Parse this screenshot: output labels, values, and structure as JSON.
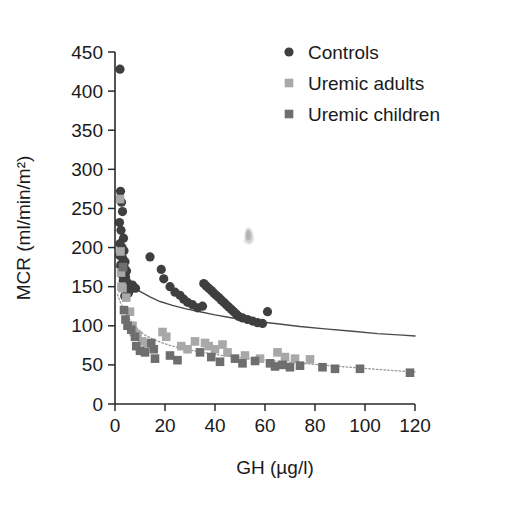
{
  "chart_data": {
    "type": "scatter",
    "title": "",
    "xlabel": "GH (µg/l)",
    "ylabel": "MCR (ml/min/m²)",
    "xlim": [
      0,
      120
    ],
    "ylim": [
      0,
      450
    ],
    "xticks": [
      0,
      20,
      40,
      60,
      80,
      100,
      120
    ],
    "yticks": [
      0,
      50,
      100,
      150,
      200,
      250,
      300,
      350,
      400,
      450
    ],
    "xtick_labels": [
      "0",
      "20",
      "40",
      "60",
      "80",
      "100",
      "120"
    ],
    "ytick_labels": [
      "0",
      "50",
      "100",
      "150",
      "200",
      "250",
      "300",
      "350",
      "400",
      "450"
    ],
    "grid": false,
    "legend_position": "top-right",
    "colors": {
      "controls": "#3f3f3f",
      "uremic_adults": "#a8a8a8",
      "uremic_children": "#6e6e6e",
      "controls_curve": "#4a4a4a",
      "uremic_curve": "#9a9a9a",
      "axis": "#2b2b2b",
      "text": "#1a1a1a",
      "background": "#ffffff"
    },
    "series": [
      {
        "name": "Controls",
        "marker": "circle",
        "color": "#3f3f3f",
        "points": [
          [
            2.0,
            428
          ],
          [
            2.2,
            272
          ],
          [
            2.6,
            258
          ],
          [
            3.0,
            246
          ],
          [
            1.8,
            232
          ],
          [
            2.4,
            222
          ],
          [
            3.4,
            212
          ],
          [
            2.0,
            205
          ],
          [
            2.8,
            200
          ],
          [
            3.6,
            196
          ],
          [
            1.9,
            190
          ],
          [
            3.1,
            186
          ],
          [
            4.0,
            182
          ],
          [
            2.3,
            178
          ],
          [
            3.8,
            174
          ],
          [
            4.6,
            170
          ],
          [
            2.7,
            166
          ],
          [
            4.2,
            162
          ],
          [
            3.3,
            158
          ],
          [
            5.0,
            155
          ],
          [
            4.8,
            150
          ],
          [
            6.0,
            146
          ],
          [
            5.4,
            142
          ],
          [
            3.9,
            138
          ],
          [
            7.0,
            152
          ],
          [
            8.2,
            148
          ],
          [
            18.5,
            172
          ],
          [
            19.5,
            160
          ],
          [
            22.0,
            150
          ],
          [
            24.0,
            143
          ],
          [
            26.0,
            139
          ],
          [
            27.5,
            134
          ],
          [
            29.0,
            130
          ],
          [
            31.0,
            127
          ],
          [
            33.0,
            123
          ],
          [
            35.5,
            154
          ],
          [
            36.5,
            151
          ],
          [
            37.5,
            148
          ],
          [
            38.5,
            145
          ],
          [
            39.5,
            142
          ],
          [
            40.5,
            139
          ],
          [
            41.5,
            136
          ],
          [
            42.5,
            133
          ],
          [
            43.5,
            130
          ],
          [
            44.5,
            127
          ],
          [
            45.5,
            124
          ],
          [
            46.5,
            121
          ],
          [
            47.5,
            118
          ],
          [
            48.5,
            115
          ],
          [
            49.5,
            112
          ],
          [
            51.0,
            110
          ],
          [
            53.0,
            108
          ],
          [
            55.0,
            106
          ],
          [
            57.0,
            104
          ],
          [
            59.0,
            103
          ],
          [
            61.0,
            118
          ],
          [
            35.0,
            125
          ],
          [
            14.0,
            188
          ]
        ]
      },
      {
        "name": "Uremic adults",
        "marker": "square",
        "color": "#a8a8a8",
        "points": [
          [
            2.0,
            262
          ],
          [
            2.2,
            195
          ],
          [
            2.4,
            168
          ],
          [
            2.6,
            150
          ],
          [
            3.0,
            148
          ],
          [
            4.5,
            136
          ],
          [
            6.0,
            118
          ],
          [
            7.0,
            100
          ],
          [
            7.5,
            92
          ],
          [
            9.0,
            88
          ],
          [
            11.0,
            80
          ],
          [
            13.0,
            76
          ],
          [
            19.0,
            92
          ],
          [
            20.5,
            86
          ],
          [
            26.5,
            74
          ],
          [
            29.0,
            70
          ],
          [
            32.0,
            80
          ],
          [
            36.0,
            78
          ],
          [
            37.5,
            74
          ],
          [
            40.0,
            70
          ],
          [
            43.0,
            76
          ],
          [
            45.0,
            66
          ],
          [
            52.0,
            62
          ],
          [
            58.0,
            58
          ],
          [
            65.0,
            66
          ],
          [
            68.0,
            60
          ],
          [
            72.0,
            58
          ],
          [
            78.0,
            57
          ]
        ]
      },
      {
        "name": "Uremic children",
        "marker": "square",
        "color": "#6e6e6e",
        "points": [
          [
            3.2,
            175
          ],
          [
            3.6,
            120
          ],
          [
            4.2,
            108
          ],
          [
            5.0,
            100
          ],
          [
            6.5,
            95
          ],
          [
            8.0,
            86
          ],
          [
            8.5,
            74
          ],
          [
            10.0,
            68
          ],
          [
            12.0,
            66
          ],
          [
            14.5,
            78
          ],
          [
            15.5,
            70
          ],
          [
            16.0,
            58
          ],
          [
            22.0,
            62
          ],
          [
            25.0,
            56
          ],
          [
            34.0,
            66
          ],
          [
            38.5,
            60
          ],
          [
            42.0,
            54
          ],
          [
            48.0,
            58
          ],
          [
            51.0,
            52
          ],
          [
            56.0,
            55
          ],
          [
            62.0,
            52
          ],
          [
            64.0,
            48
          ],
          [
            67.0,
            50
          ],
          [
            70.0,
            47
          ],
          [
            74.0,
            49
          ],
          [
            83.0,
            47
          ],
          [
            88.0,
            45
          ],
          [
            98.0,
            45
          ],
          [
            118.0,
            40
          ]
        ]
      }
    ],
    "fit_curves": [
      {
        "name": "Controls fit",
        "color": "#4a4a4a",
        "style": "solid",
        "points": [
          [
            0.5,
            176
          ],
          [
            1.5,
            172
          ],
          [
            3,
            166
          ],
          [
            5,
            158
          ],
          [
            7,
            151
          ],
          [
            10,
            144
          ],
          [
            14,
            137
          ],
          [
            18,
            131
          ],
          [
            23,
            126
          ],
          [
            28,
            122
          ],
          [
            34,
            118
          ],
          [
            40,
            114
          ],
          [
            47,
            110
          ],
          [
            55,
            106
          ],
          [
            64,
            103
          ],
          [
            74,
            99
          ],
          [
            84,
            96
          ],
          [
            95,
            93
          ],
          [
            105,
            90
          ],
          [
            115,
            88
          ],
          [
            120,
            87
          ]
        ]
      },
      {
        "name": "Uremic fit",
        "color": "#9a9a9a",
        "style": "dotted",
        "points": [
          [
            1.0,
            140
          ],
          [
            2,
            131
          ],
          [
            3.5,
            121
          ],
          [
            5,
            112
          ],
          [
            7,
            103
          ],
          [
            9,
            96
          ],
          [
            12,
            88
          ],
          [
            15,
            83
          ],
          [
            19,
            78
          ],
          [
            24,
            73
          ],
          [
            30,
            69
          ],
          [
            37,
            65
          ],
          [
            45,
            61
          ],
          [
            54,
            58
          ],
          [
            64,
            55
          ],
          [
            75,
            52
          ],
          [
            86,
            49
          ],
          [
            98,
            46
          ],
          [
            110,
            43
          ],
          [
            120,
            41
          ]
        ]
      }
    ],
    "artifacts": [
      {
        "name": "smudge",
        "x": 53.5,
        "y": 215,
        "color": "#b4b4b4"
      }
    ],
    "legend": [
      {
        "label": "Controls",
        "marker": "circle",
        "color": "#3f3f3f"
      },
      {
        "label": "Uremic adults",
        "marker": "square",
        "color": "#a8a8a8"
      },
      {
        "label": "Uremic children",
        "marker": "square",
        "color": "#6e6e6e"
      }
    ]
  }
}
